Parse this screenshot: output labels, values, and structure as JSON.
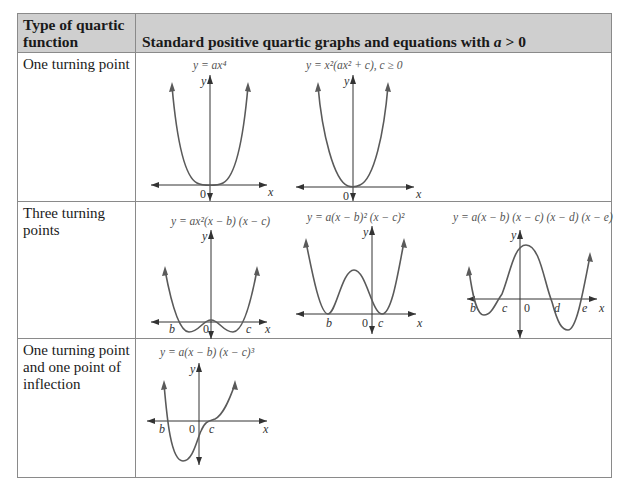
{
  "table": {
    "header": {
      "col1": "Type of quartic function",
      "col2_prefix": "Standard positive quartic graphs and equations with ",
      "col2_var": "a",
      "col2_suffix": " > 0"
    },
    "rows": [
      {
        "label": "One turning point",
        "graphs": [
          {
            "equation": "y = ax⁴",
            "axis_x": "x",
            "axis_y": "y",
            "origin": "0",
            "points": []
          },
          {
            "equation": "y = x²(ax² + c), c ≥ 0",
            "axis_x": "x",
            "axis_y": "y",
            "origin": "0",
            "points": []
          }
        ]
      },
      {
        "label": "Three turning points",
        "graphs": [
          {
            "equation": "y = ax²(x − b) (x − c)",
            "axis_x": "x",
            "axis_y": "y",
            "origin": "0",
            "points": [
              "b",
              "c"
            ]
          },
          {
            "equation": "y = a(x − b)² (x − c)²",
            "axis_x": "x",
            "axis_y": "y",
            "origin": "0",
            "points": [
              "b",
              "c"
            ]
          },
          {
            "equation": "y = a(x − b) (x − c) (x − d) (x − e)",
            "axis_x": "x",
            "axis_y": "y",
            "origin": "0",
            "points": [
              "b",
              "c",
              "d",
              "e"
            ]
          }
        ]
      },
      {
        "label": "One turning point and one point of inflection",
        "graphs": [
          {
            "equation": "y = a(x − b) (x − c)³",
            "axis_x": "x",
            "axis_y": "y",
            "origin": "0",
            "points": [
              "b",
              "c"
            ]
          }
        ]
      }
    ]
  }
}
